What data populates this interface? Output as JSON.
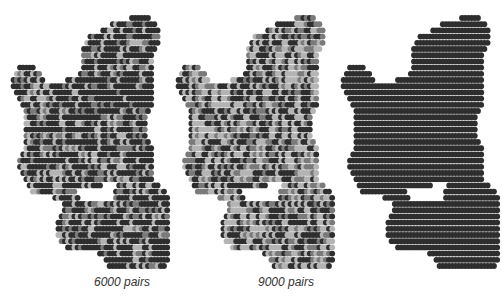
{
  "figure": {
    "panels": [
      {
        "id": "map-6000",
        "caption": "6000 pairs",
        "left": 0,
        "caption_left": 60
      },
      {
        "id": "map-9000",
        "caption": "9000 pairs",
        "left": 165,
        "caption_left": 222
      },
      {
        "id": "map-full",
        "caption": "",
        "left": 330,
        "caption_left": 390
      }
    ],
    "colors": {
      "dark": "#2e2e2e",
      "mid": "#7a7a7a",
      "light": "#b4b4b4",
      "outline": "#444444"
    },
    "grid": {
      "pitch": 8,
      "radius": 3.6,
      "origin_x": 12,
      "origin_y": 18
    },
    "shape_rows": [
      [
        40,
        45
      ],
      [
        34,
        47
      ],
      [
        31,
        48
      ],
      [
        27,
        48
      ],
      [
        26,
        48
      ],
      [
        25,
        47
      ],
      [
        25,
        46
      ],
      [
        25,
        46
      ],
      [
        5,
        9,
        25,
        46
      ],
      [
        4,
        11,
        24,
        46
      ],
      [
        3,
        12,
        20,
        46
      ],
      [
        3,
        46
      ],
      [
        4,
        46
      ],
      [
        5,
        46
      ],
      [
        6,
        46
      ],
      [
        7,
        45
      ],
      [
        7,
        44
      ],
      [
        7,
        44
      ],
      [
        7,
        44
      ],
      [
        7,
        44
      ],
      [
        7,
        45
      ],
      [
        7,
        46
      ],
      [
        6,
        46
      ],
      [
        5,
        46
      ],
      [
        5,
        46
      ],
      [
        6,
        46
      ],
      [
        7,
        46
      ],
      [
        8,
        30,
        36,
        48
      ],
      [
        9,
        22,
        35,
        50
      ],
      [
        16,
        23,
        35,
        51
      ],
      [
        19,
        51
      ],
      [
        19,
        51
      ],
      [
        18,
        52
      ],
      [
        17,
        52
      ],
      [
        17,
        53
      ],
      [
        17,
        53
      ],
      [
        18,
        54
      ],
      [
        20,
        52
      ],
      [
        30,
        52
      ],
      [
        32,
        51
      ],
      [
        33,
        50
      ]
    ]
  }
}
